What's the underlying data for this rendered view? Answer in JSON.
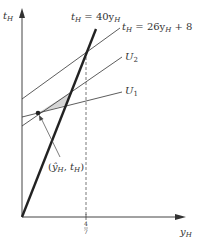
{
  "diagram": {
    "axes": {
      "y_label": "t",
      "y_label_sub": "H",
      "x_label": "y",
      "x_label_sub": "H"
    },
    "lines": [
      {
        "id": "steep",
        "label_main": "t",
        "label_sub": "H",
        "label_rest": " = 40y",
        "label_rest_sub": "H",
        "style": "thick"
      },
      {
        "id": "budget",
        "label_main": "t",
        "label_sub": "H",
        "label_rest": " = 26y",
        "label_rest_sub": "H",
        "label_tail": " + 8",
        "style": "thin"
      },
      {
        "id": "u2",
        "label_main": "U",
        "label_sub": "2",
        "style": "thin"
      },
      {
        "id": "u1",
        "label_main": "U",
        "label_sub": "1",
        "style": "thin"
      }
    ],
    "point": {
      "label_open": "(",
      "label_y": "ŷ",
      "label_y_sub": "H",
      "label_sep": ", ",
      "label_t": "t",
      "label_t_sub": "H",
      "label_close": ")"
    },
    "x_tick": {
      "numerator": "4",
      "denominator": "7"
    },
    "colors": {
      "line": "#333333",
      "shade": "#d6d6d6"
    }
  }
}
